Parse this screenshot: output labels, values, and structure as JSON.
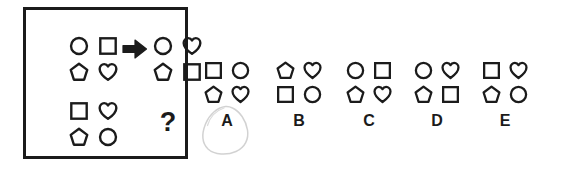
{
  "puzzle": {
    "type": "visual-analogy-matrix",
    "question_symbol": "?",
    "arrow_symbol": "right-arrow",
    "stem": {
      "top_left_group": {
        "name": "source-pattern",
        "shapes": [
          {
            "position": "top-left",
            "shape": "circle"
          },
          {
            "position": "top-right",
            "shape": "square"
          },
          {
            "position": "bottom-left",
            "shape": "pentagon"
          },
          {
            "position": "bottom-right",
            "shape": "heart"
          }
        ]
      },
      "top_right_group": {
        "name": "transformed-pattern",
        "shapes": [
          {
            "position": "top-left",
            "shape": "circle"
          },
          {
            "position": "top-right",
            "shape": "heart"
          },
          {
            "position": "bottom-left",
            "shape": "pentagon"
          },
          {
            "position": "bottom-right",
            "shape": "square"
          }
        ]
      },
      "bottom_left_group": {
        "name": "query-pattern",
        "shapes": [
          {
            "position": "top-left",
            "shape": "square"
          },
          {
            "position": "top-right",
            "shape": "heart"
          },
          {
            "position": "bottom-left",
            "shape": "pentagon"
          },
          {
            "position": "bottom-right",
            "shape": "circle"
          }
        ]
      },
      "bottom_right_group": {
        "name": "answer-placeholder",
        "label": "?"
      }
    },
    "options": [
      {
        "letter": "A",
        "selected": true,
        "shapes": [
          {
            "position": "top-left",
            "shape": "square"
          },
          {
            "position": "top-right",
            "shape": "circle"
          },
          {
            "position": "bottom-left",
            "shape": "pentagon"
          },
          {
            "position": "bottom-right",
            "shape": "heart"
          }
        ]
      },
      {
        "letter": "B",
        "selected": false,
        "shapes": [
          {
            "position": "top-left",
            "shape": "pentagon"
          },
          {
            "position": "top-right",
            "shape": "heart"
          },
          {
            "position": "bottom-left",
            "shape": "square"
          },
          {
            "position": "bottom-right",
            "shape": "circle"
          }
        ]
      },
      {
        "letter": "C",
        "selected": false,
        "shapes": [
          {
            "position": "top-left",
            "shape": "circle"
          },
          {
            "position": "top-right",
            "shape": "square"
          },
          {
            "position": "bottom-left",
            "shape": "pentagon"
          },
          {
            "position": "bottom-right",
            "shape": "heart"
          }
        ]
      },
      {
        "letter": "D",
        "selected": false,
        "shapes": [
          {
            "position": "top-left",
            "shape": "circle"
          },
          {
            "position": "top-right",
            "shape": "heart"
          },
          {
            "position": "bottom-left",
            "shape": "pentagon"
          },
          {
            "position": "bottom-right",
            "shape": "square"
          }
        ]
      },
      {
        "letter": "E",
        "selected": false,
        "shapes": [
          {
            "position": "top-left",
            "shape": "square"
          },
          {
            "position": "top-right",
            "shape": "heart"
          },
          {
            "position": "bottom-left",
            "shape": "pentagon"
          },
          {
            "position": "bottom-right",
            "shape": "circle"
          }
        ]
      }
    ],
    "colors": {
      "stroke": "#1b1b1b",
      "background": "#ffffff",
      "selection_mark": "#d7d7d7"
    }
  }
}
